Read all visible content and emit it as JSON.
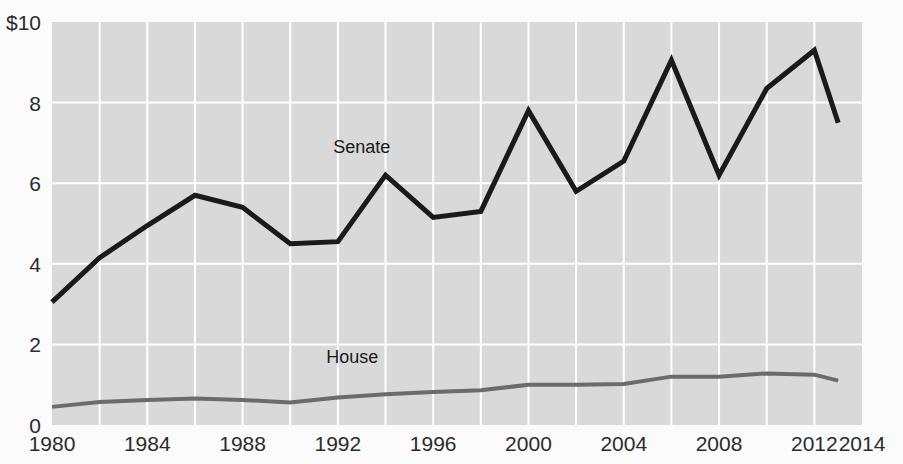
{
  "chart_data": {
    "type": "line",
    "title": "",
    "subtitle": "",
    "xlabel": "",
    "ylabel": "",
    "grid": true,
    "legend_position": "inline-annotation",
    "plot_background": "#d9d9d9",
    "page_background": "#fbfbfb",
    "gridline_color": "#ffffff",
    "xlim": [
      1980,
      2014
    ],
    "ylim": [
      0,
      10
    ],
    "x_ticks": [
      1980,
      1984,
      1988,
      1992,
      1996,
      2000,
      2004,
      2008,
      2012,
      2014
    ],
    "x_tick_labels": [
      "1980",
      "1984",
      "1988",
      "1992",
      "1996",
      "2000",
      "2004",
      "2008",
      "2012",
      "2014"
    ],
    "x_gridlines": [
      1982,
      1984,
      1986,
      1988,
      1990,
      1992,
      1994,
      1996,
      1998,
      2000,
      2002,
      2004,
      2006,
      2008,
      2010,
      2012
    ],
    "y_ticks": [
      0,
      2,
      4,
      6,
      8,
      10
    ],
    "y_tick_labels": [
      "0",
      "2",
      "4",
      "6",
      "8",
      "$10"
    ],
    "y_gridlines": [
      2,
      4,
      6,
      8
    ],
    "x": [
      1980,
      1982,
      1984,
      1986,
      1988,
      1990,
      1992,
      1994,
      1996,
      1998,
      2000,
      2002,
      2004,
      2006,
      2008,
      2010,
      2012,
      2013
    ],
    "series": [
      {
        "name": "Senate",
        "color": "#1a1a1a",
        "width": 5,
        "label_x": 1993.0,
        "label_y": 6.75,
        "values": [
          3.05,
          4.15,
          4.95,
          5.7,
          5.4,
          4.5,
          4.55,
          6.2,
          5.15,
          5.3,
          7.8,
          5.8,
          6.55,
          9.05,
          6.2,
          8.35,
          9.3,
          7.5
        ]
      },
      {
        "name": "House",
        "color": "#6b6b6b",
        "width": 4,
        "label_x": 1992.6,
        "label_y": 1.55,
        "values": [
          0.45,
          0.57,
          0.62,
          0.66,
          0.62,
          0.56,
          0.68,
          0.76,
          0.82,
          0.86,
          1.0,
          1.0,
          1.02,
          1.2,
          1.2,
          1.28,
          1.25,
          1.1
        ]
      }
    ]
  }
}
